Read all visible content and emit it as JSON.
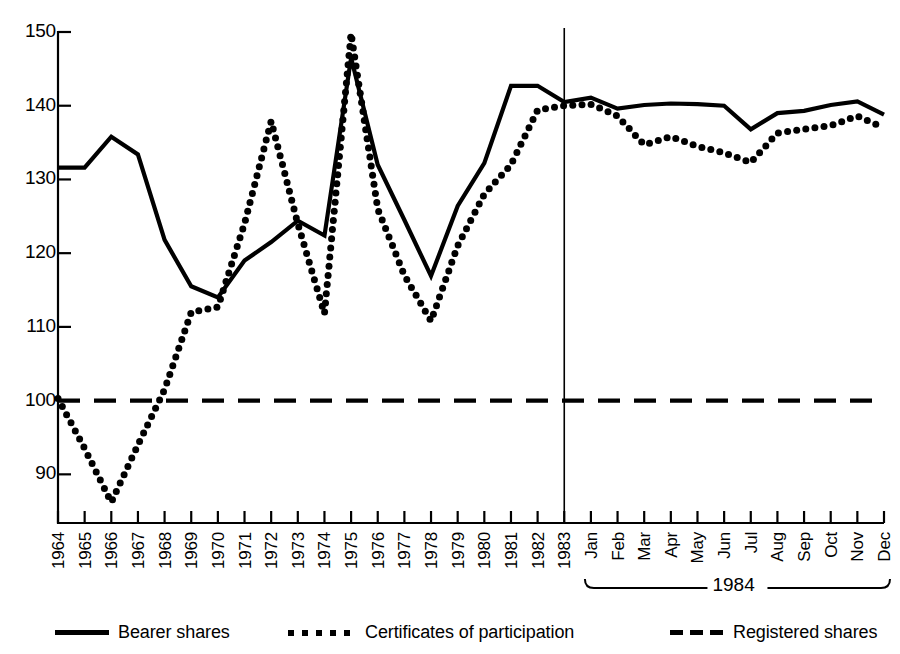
{
  "chart_data": {
    "type": "line",
    "title": "",
    "xlabel": "",
    "ylabel": "",
    "ylim": [
      84,
      150
    ],
    "yticks": [
      90,
      100,
      110,
      120,
      130,
      140,
      150
    ],
    "grid": false,
    "legend_position": "bottom",
    "annotations": [
      {
        "text": "1984",
        "kind": "brace-label",
        "covers": [
          "Jan",
          "Feb",
          "Mar",
          "Apr",
          "May",
          "Jun",
          "Jul",
          "Aug",
          "Sep",
          "Oct",
          "Nov",
          "Dec"
        ]
      },
      {
        "text": "",
        "kind": "vertical-divider",
        "at": "1983"
      }
    ],
    "categories": [
      "1964",
      "1965",
      "1966",
      "1967",
      "1968",
      "1969",
      "1970",
      "1971",
      "1972",
      "1973",
      "1974",
      "1975",
      "1976",
      "1977",
      "1978",
      "1979",
      "1980",
      "1981",
      "1982",
      "1983",
      "Jan",
      "Feb",
      "Mar",
      "Apr",
      "May",
      "Jun",
      "Jul",
      "Aug",
      "Sep",
      "Oct",
      "Nov",
      "Dec"
    ],
    "series": [
      {
        "name": "Bearer shares",
        "style": "solid",
        "values": [
          131.6,
          131.6,
          135.8,
          133.4,
          121.8,
          115.5,
          114.0,
          119.0,
          121.5,
          124.4,
          122.4,
          146.5,
          132.0,
          124.5,
          116.9,
          126.4,
          132.2,
          142.7,
          142.7,
          140.5,
          141.1,
          139.6,
          140.1,
          140.3,
          140.2,
          140.0,
          136.8,
          139.0,
          139.3,
          140.1,
          140.6,
          138.8
        ]
      },
      {
        "name": "Certificates of participation",
        "style": "dotted",
        "values": [
          100.3,
          93.5,
          86.2,
          94.0,
          101.5,
          112.0,
          112.7,
          124.0,
          137.9,
          124.0,
          111.8,
          149.8,
          126.0,
          117.0,
          110.8,
          121.0,
          128.0,
          132.0,
          139.4,
          140.0,
          140.2,
          138.6,
          134.7,
          135.8,
          134.5,
          133.6,
          132.3,
          136.3,
          136.8,
          137.3,
          138.6,
          137.0
        ]
      },
      {
        "name": "Registered shares",
        "style": "dashed",
        "values": [
          100,
          100,
          100,
          100,
          100,
          100,
          100,
          100,
          100,
          100,
          100,
          100,
          100,
          100,
          100,
          100,
          100,
          100,
          100,
          100,
          100,
          100,
          100,
          100,
          100,
          100,
          100,
          100,
          100,
          100,
          100,
          100
        ]
      }
    ]
  },
  "legend": {
    "items": [
      {
        "label": "Bearer shares",
        "style": "solid"
      },
      {
        "label": "Certificates of participation",
        "style": "dotted"
      },
      {
        "label": "Registered shares",
        "style": "dashed"
      }
    ]
  }
}
